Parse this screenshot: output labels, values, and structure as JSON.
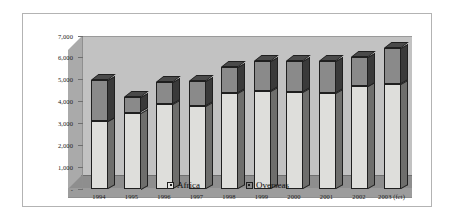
{
  "chart_data": {
    "type": "bar",
    "subtype": "stacked-column-3d",
    "title": "",
    "subtitle": "",
    "xlabel": "",
    "ylabel": "",
    "categories": [
      "1994",
      "1995",
      "1996",
      "1997",
      "1998",
      "1999",
      "2000",
      "2001",
      "2002",
      "2003 (fct)"
    ],
    "series": [
      {
        "name": "Africa",
        "color": "#dededb",
        "values": [
          3100,
          3500,
          3880,
          3820,
          4400,
          4500,
          4450,
          4380,
          4700,
          4800
        ]
      },
      {
        "name": "Overseas",
        "color": "#8a8a8a",
        "values": [
          1900,
          700,
          1020,
          1130,
          1200,
          1350,
          1400,
          1470,
          1350,
          1650
        ]
      }
    ],
    "totals": [
      5000,
      4200,
      4900,
      4950,
      5600,
      5850,
      5850,
      5850,
      6050,
      6450
    ],
    "ylim": [
      0,
      7000
    ],
    "ytick_values": [
      0,
      1000,
      2000,
      3000,
      4000,
      5000,
      6000,
      7000
    ],
    "ytick_labels": [
      "-",
      "1,000",
      "2,000",
      "3,000",
      "4,000",
      "5,000",
      "6,000",
      "7,000"
    ],
    "grid": false,
    "legend_position": "bottom",
    "legend_entries": [
      {
        "label": "Africa",
        "swatch": "light-gray-square"
      },
      {
        "label": "Overseas",
        "swatch": "dark-gray-square"
      }
    ]
  },
  "colors": {
    "plot_back_wall": "#c2c2c2",
    "plot_side_wall": "#aaaaaa",
    "plot_floor": "#8e8e8e",
    "series_africa": "#dededb",
    "series_overseas": "#8a8a8a",
    "bar_outline": "#1f1f1f",
    "frame_border": "#b3b3b3",
    "page_background": "#ffffff"
  }
}
